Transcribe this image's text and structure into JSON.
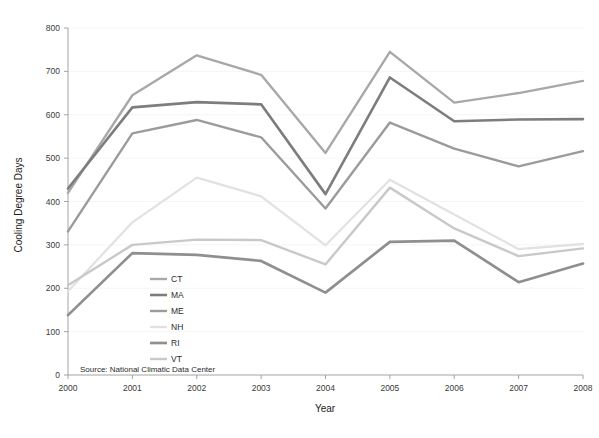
{
  "chart_data": {
    "type": "line",
    "title": "",
    "xlabel": "Year",
    "ylabel": "Cooling Degree Days",
    "categories": [
      2000,
      2001,
      2002,
      2003,
      2004,
      2005,
      2006,
      2007,
      2008
    ],
    "x": [
      2000,
      2001,
      2002,
      2003,
      2004,
      2005,
      2006,
      2007,
      2008
    ],
    "xlim": [
      2000,
      2008
    ],
    "ylim": [
      0,
      800
    ],
    "yticks": [
      0,
      100,
      200,
      300,
      400,
      500,
      600,
      700,
      800
    ],
    "xticks": [
      "2000",
      "2001",
      "2002",
      "2003",
      "2004",
      "2005",
      "2006",
      "2007",
      "2008"
    ],
    "grid": false,
    "legend_position": "inside-lower-left",
    "source_note": "Source: National Climatic Data Center",
    "series": [
      {
        "name": "CT",
        "color": "#a8a8a8",
        "width": 2.4,
        "values": [
          420,
          645,
          737,
          692,
          512,
          745,
          628,
          650,
          678
        ]
      },
      {
        "name": "MA",
        "color": "#7d7d7d",
        "width": 2.6,
        "values": [
          430,
          617,
          629,
          624,
          417,
          686,
          585,
          589,
          590
        ]
      },
      {
        "name": "ME",
        "color": "#9b9b9b",
        "width": 2.4,
        "values": [
          331,
          557,
          588,
          548,
          384,
          582,
          522,
          481,
          516
        ]
      },
      {
        "name": "NH",
        "color": "#e2e2e2",
        "width": 2.3,
        "values": [
          193,
          352,
          455,
          412,
          299,
          450,
          370,
          290,
          302
        ]
      },
      {
        "name": "RI",
        "color": "#8f8f8f",
        "width": 2.7,
        "values": [
          138,
          281,
          277,
          263,
          190,
          307,
          310,
          214,
          257
        ]
      },
      {
        "name": "VT",
        "color": "#c9c9c9",
        "width": 2.4,
        "values": [
          207,
          300,
          312,
          311,
          255,
          432,
          338,
          274,
          292
        ]
      }
    ]
  },
  "legend": {
    "items": [
      {
        "label": "CT"
      },
      {
        "label": "MA"
      },
      {
        "label": "ME"
      },
      {
        "label": "NH"
      },
      {
        "label": "RI"
      },
      {
        "label": "VT"
      }
    ]
  },
  "axes": {
    "y_title": "Cooling Degree Days",
    "x_title": "Year"
  },
  "footer": {
    "source": "Source: National Climatic Data Center"
  }
}
